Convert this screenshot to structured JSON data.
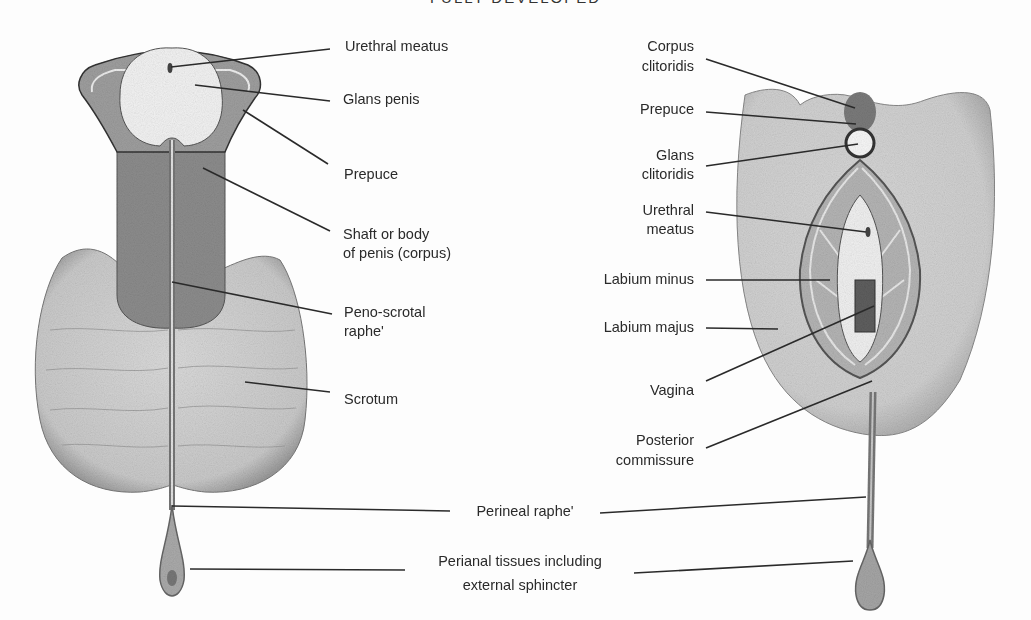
{
  "figure": {
    "title": "FULLY DEVELOPED",
    "colors": {
      "background": "#fdfdfd",
      "light_tissue": "#d8d8d8",
      "dark_tissue": "#8c8c8c",
      "glans": "#f2f2f2",
      "line": "#2a2a2a"
    }
  },
  "male": {
    "labels": [
      {
        "id": "urethral-meatus",
        "text": "Urethral meatus"
      },
      {
        "id": "glans-penis",
        "text": "Glans penis"
      },
      {
        "id": "prepuce",
        "text": "Prepuce"
      },
      {
        "id": "shaft-1",
        "text": "Shaft or body"
      },
      {
        "id": "shaft-2",
        "text": "of penis (corpus)"
      },
      {
        "id": "peno-scrotal-1",
        "text": "Peno-scrotal"
      },
      {
        "id": "peno-scrotal-2",
        "text": "raphe'"
      },
      {
        "id": "scrotum",
        "text": "Scrotum"
      }
    ]
  },
  "female": {
    "labels": [
      {
        "id": "corpus-clitoridis-1",
        "text": "Corpus"
      },
      {
        "id": "corpus-clitoridis-2",
        "text": "clitoridis"
      },
      {
        "id": "prepuce",
        "text": "Prepuce"
      },
      {
        "id": "glans-clitoridis-1",
        "text": "Glans"
      },
      {
        "id": "glans-clitoridis-2",
        "text": "clitoridis"
      },
      {
        "id": "urethral-meatus-1",
        "text": "Urethral"
      },
      {
        "id": "urethral-meatus-2",
        "text": "meatus"
      },
      {
        "id": "labium-minus",
        "text": "Labium minus"
      },
      {
        "id": "labium-majus",
        "text": "Labium majus"
      },
      {
        "id": "vagina",
        "text": "Vagina"
      },
      {
        "id": "posterior-commissure-1",
        "text": "Posterior"
      },
      {
        "id": "posterior-commissure-2",
        "text": "commissure"
      }
    ]
  },
  "shared": {
    "perineal_raphe": "Perineal raphe'",
    "perianal_1": "Perianal tissues including",
    "perianal_2": "external sphincter"
  }
}
